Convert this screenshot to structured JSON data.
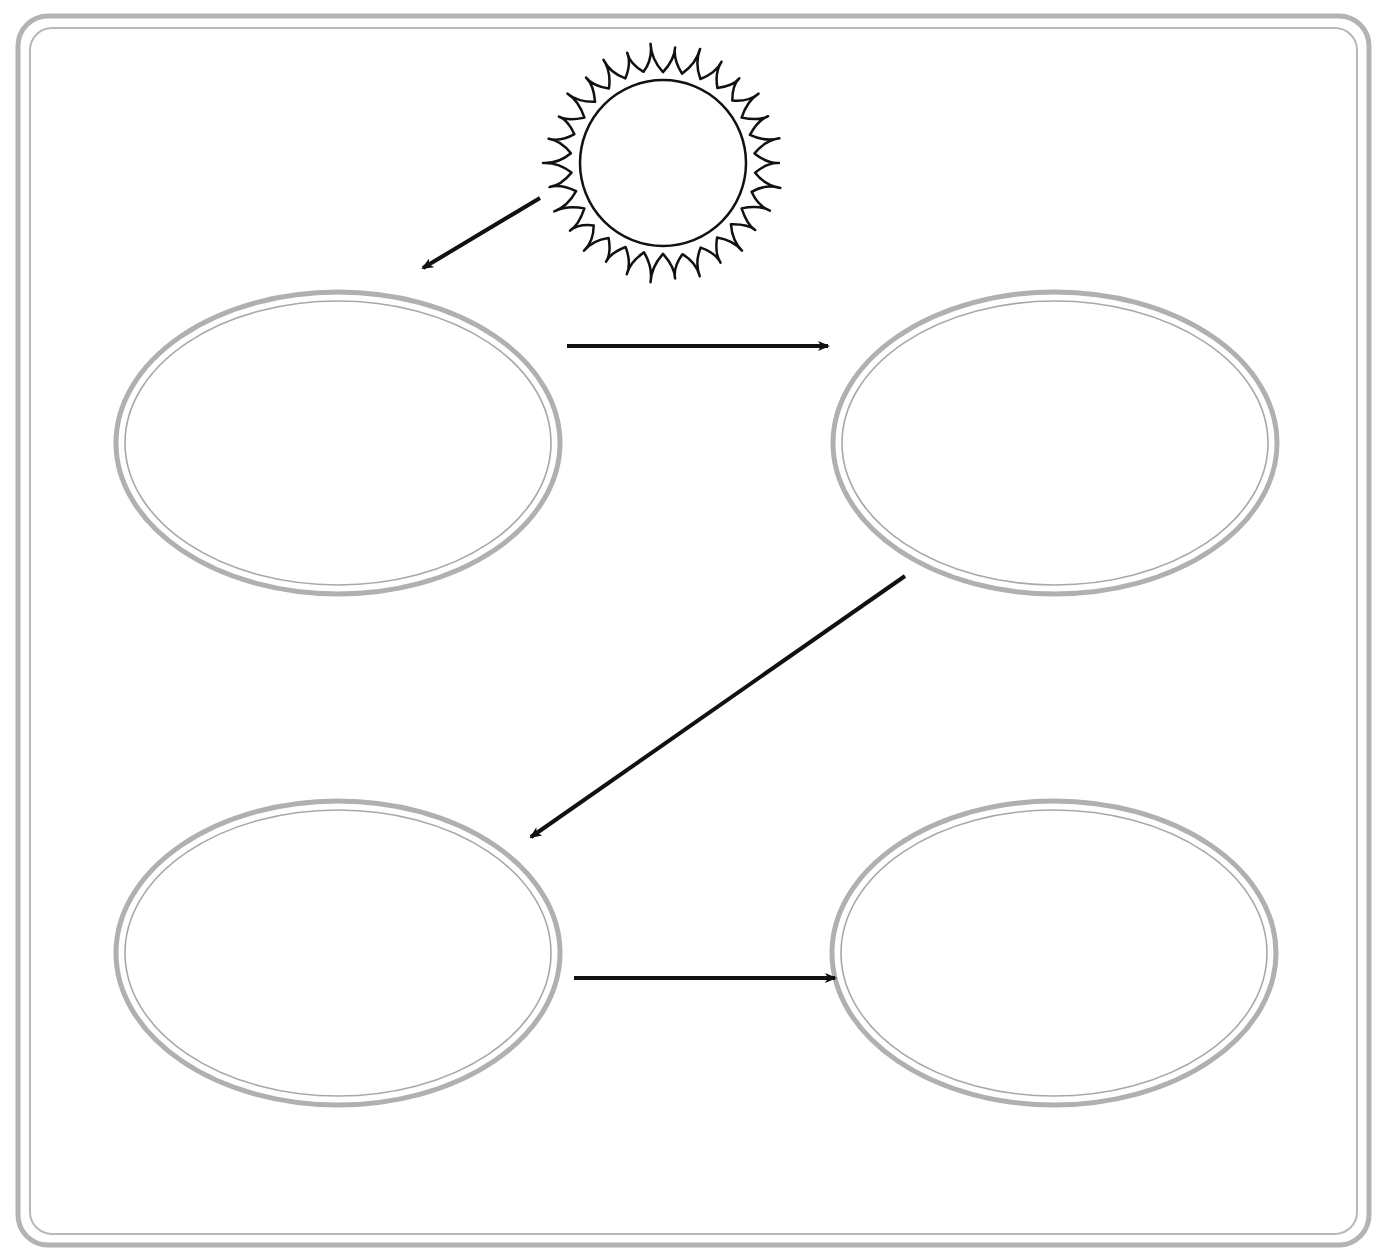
{
  "diagram": {
    "type": "flow-chart",
    "colors": {
      "background": "#ffffff",
      "frame_outer": "#b3b3b3",
      "frame_inner": "#b8b8b8",
      "node_outer": "#b0b0b0",
      "node_inner": "#a8a8a8",
      "arrow": "#111111",
      "sun": "#111111"
    },
    "frame": {
      "outer": {
        "x": 18,
        "y": 16,
        "w": 1351,
        "h": 1229,
        "r": 30,
        "stroke": 5
      },
      "inner": {
        "x": 30,
        "y": 28,
        "w": 1327,
        "h": 1206,
        "r": 22,
        "stroke": 2
      }
    },
    "sun": {
      "icon": "sun-icon",
      "cx": 663,
      "cy": 163,
      "r": 83,
      "flame_inner_r": 92,
      "flame_outer_r": 117,
      "flame_count": 30,
      "label": ""
    },
    "nodes": [
      {
        "id": "node-1",
        "cx": 338,
        "cy": 443,
        "rx": 222,
        "ry": 151,
        "label": ""
      },
      {
        "id": "node-2",
        "cx": 1055,
        "cy": 443,
        "rx": 222,
        "ry": 151,
        "label": ""
      },
      {
        "id": "node-3",
        "cx": 338,
        "cy": 953,
        "rx": 222,
        "ry": 152,
        "label": ""
      },
      {
        "id": "node-4",
        "cx": 1054,
        "cy": 953,
        "rx": 222,
        "ry": 152,
        "label": ""
      }
    ],
    "arrows": [
      {
        "id": "arrow-sun-to-node-1",
        "from": "sun",
        "to": "node-1",
        "x1": 540,
        "y1": 198,
        "x2": 423,
        "y2": 268
      },
      {
        "id": "arrow-node-1-to-node-2",
        "from": "node-1",
        "to": "node-2",
        "x1": 567,
        "y1": 346,
        "x2": 828,
        "y2": 346
      },
      {
        "id": "arrow-node-2-to-node-3",
        "from": "node-2",
        "to": "node-3",
        "x1": 905,
        "y1": 576,
        "x2": 531,
        "y2": 837
      },
      {
        "id": "arrow-node-3-to-node-4",
        "from": "node-3",
        "to": "node-4",
        "x1": 574,
        "y1": 978,
        "x2": 835,
        "y2": 978
      }
    ]
  }
}
